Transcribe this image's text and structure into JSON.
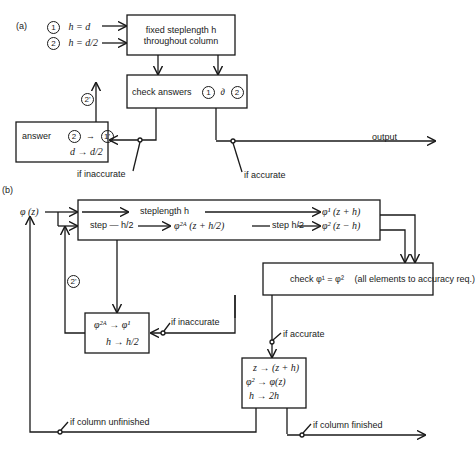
{
  "panel_a": {
    "label": "(a)",
    "inputs": [
      {
        "marker": "1",
        "text": "h = d"
      },
      {
        "marker": "2",
        "text": "h = d/2"
      }
    ],
    "fixed_box": {
      "line1": "fixed steplength h",
      "line2": "throughout column"
    },
    "check_box": {
      "text": "check answers",
      "m1": "1",
      "sym": "∂",
      "m2": "2"
    },
    "answer_box": {
      "label": "answer",
      "m_from": "2",
      "arrow": "→",
      "m_to": "1'",
      "line2": "d → d/2"
    },
    "feedback_marker": "2'",
    "if_inaccurate": "if inaccurate",
    "if_accurate": "if accurate",
    "output": "output"
  },
  "panel_b": {
    "label": "(b)",
    "input": "φ (z)",
    "step_box": {
      "row1_label": "steplength h",
      "row1_result": "φ¹ (z + h)",
      "row2_step": "step — h/2",
      "row2_mid": "φ²ᴬ (z + h/2)",
      "row2_step2": "step h/2",
      "row2_result": "φ² (z − h)"
    },
    "check_box": {
      "text": "check  φ¹ = φ²",
      "note": "(all elements to accuracy req.)"
    },
    "halve_box": {
      "line1": "φ²ᴬ → φ¹",
      "line2": "h → h/2"
    },
    "feedback_marker": "2'",
    "if_inaccurate": "if inaccurate",
    "if_accurate": "if accurate",
    "advance_box": {
      "line1": "z → (z + h)",
      "line2": "φ² → φ(z)",
      "line3": "h → 2h"
    },
    "if_unfinished": "if column unfinished",
    "if_finished": "if column finished"
  }
}
